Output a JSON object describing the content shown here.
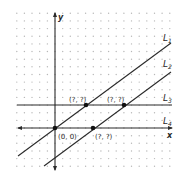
{
  "diagram": {
    "type": "coordinate-plane",
    "axes": {
      "x_label": "x",
      "y_label": "y"
    },
    "lines": [
      {
        "name": "L",
        "sub": "1",
        "kind": "slanted",
        "description": "passes through origin"
      },
      {
        "name": "L",
        "sub": "2",
        "kind": "slanted",
        "description": "parallel to L1"
      },
      {
        "name": "L",
        "sub": "3",
        "kind": "horizontal",
        "description": "horizontal line above x-axis"
      },
      {
        "name": "L",
        "sub": "4",
        "kind": "horizontal",
        "description": "x-axis"
      }
    ],
    "points": [
      {
        "label": "(0, 0)",
        "location": "L1 ∩ L4"
      },
      {
        "label": "(?, ?)",
        "location": "L1 ∩ L3"
      },
      {
        "label": "(?, ?)",
        "location": "L2 ∩ L3"
      },
      {
        "label": "(?, ?)",
        "location": "L2 ∩ L4"
      }
    ],
    "colors": {
      "line": "#2a2a2a",
      "grid_dot": "#b8b8b8",
      "background": "#ffffff"
    }
  }
}
